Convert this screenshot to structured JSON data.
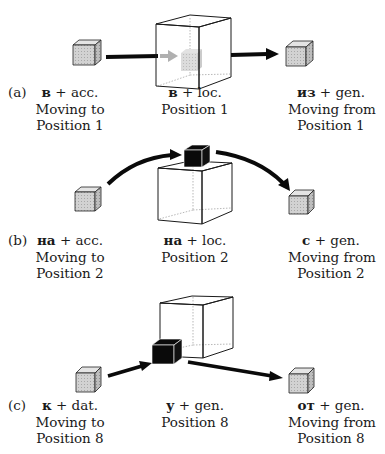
{
  "figure": {
    "colors": {
      "small_cube_fill": "#cfcfcf",
      "small_cube_side": "#b5b5b5",
      "black_cube": "#0a0a0a",
      "big_cube_line": "#1a1a1a",
      "hidden_line": "#9a9a9a",
      "ghost": "#b0b0b0",
      "arrow": "#0a0a0a"
    },
    "rows": [
      {
        "tag": "(a)",
        "left": {
          "prep": "в",
          "case": "+ acc.",
          "line2": "Moving to",
          "line3": "Position 1"
        },
        "center": {
          "prep": "в",
          "case": "+ loc.",
          "line2": "Position 1"
        },
        "right": {
          "prep": "из",
          "case": "+ gen.",
          "line2": "Moving from",
          "line3": "Position 1"
        }
      },
      {
        "tag": "(b)",
        "left": {
          "prep": "на",
          "case": "+ acc.",
          "line2": "Moving to",
          "line3": "Position 2"
        },
        "center": {
          "prep": "на",
          "case": "+ loc.",
          "line2": "Position 2"
        },
        "right": {
          "prep": "с",
          "case": "+ gen.",
          "line2": "Moving from",
          "line3": "Position 2"
        }
      },
      {
        "tag": "(c)",
        "left": {
          "prep": "к",
          "case": "+ dat.",
          "line2": "Moving to",
          "line3": "Position 8"
        },
        "center": {
          "prep": "у",
          "case": "+ gen.",
          "line2": "Position 8"
        },
        "right": {
          "prep": "от",
          "case": "+ gen.",
          "line2": "Moving from",
          "line3": "Position 8"
        }
      }
    ]
  }
}
